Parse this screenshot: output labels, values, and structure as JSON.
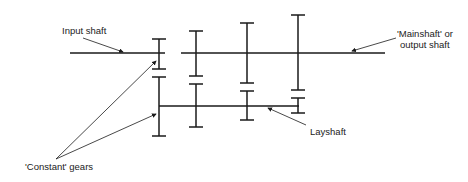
{
  "diagram": {
    "type": "gearbox-layout",
    "colors": {
      "line": "#1a1a1a",
      "text": "#222222",
      "background": "#ffffff"
    },
    "labels": {
      "input_shaft": "Input shaft",
      "mainshaft_line1": "'Mainshaft' or",
      "mainshaft_line2": "output shaft",
      "layshaft": "Layshaft",
      "constant_gears": "'Constant' gears"
    },
    "shafts": [
      {
        "name": "input-shaft",
        "y": 53,
        "x1": 70,
        "x2": 165
      },
      {
        "name": "mainshaft",
        "y": 53,
        "x1": 181,
        "x2": 385
      },
      {
        "name": "layshaft",
        "y": 106,
        "x1": 159,
        "x2": 299
      }
    ],
    "gear_pairs": [
      {
        "x": 159,
        "main": [
          39,
          69
        ],
        "lay": [
          77,
          136
        ],
        "constant": true
      },
      {
        "x": 196,
        "main": [
          31,
          76
        ],
        "lay": [
          84,
          127
        ]
      },
      {
        "x": 247,
        "main": [
          23,
          83
        ],
        "lay": [
          91,
          120
        ]
      },
      {
        "x": 298,
        "main": [
          15,
          90
        ],
        "lay": [
          98,
          113
        ]
      }
    ]
  }
}
